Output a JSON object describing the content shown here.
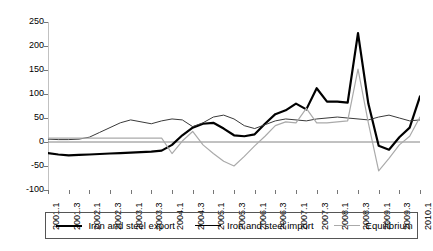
{
  "chart_data": {
    "type": "line",
    "title": "",
    "subtitle": "",
    "xlabel": "",
    "ylabel": "",
    "ylim": [
      -100,
      250
    ],
    "yticks": [
      250,
      200,
      150,
      100,
      50,
      0,
      -50,
      -100
    ],
    "ytick_labels": [
      "250",
      "200",
      "150",
      "100",
      "50",
      "0",
      "-50",
      "-100"
    ],
    "grid": false,
    "legend_position": "bottom",
    "x": [
      "2001.1",
      "2001.2",
      "2001.3",
      "2001.4",
      "2002.1",
      "2002.2",
      "2002.3",
      "2002.4",
      "2003.1",
      "2003.2",
      "2003.3",
      "2003.4",
      "2004.1",
      "2004.2",
      "2004.3",
      "2004.4",
      "2005.1",
      "2005.2",
      "2005.3",
      "2005.4",
      "2006.1",
      "2006.2",
      "2006.3",
      "2006.4",
      "2007.1",
      "2007.2",
      "2007.3",
      "2007.4",
      "2008.1",
      "2008.2",
      "2008.3",
      "2008.4",
      "2009.1",
      "2009.2",
      "2009.3",
      "2009.4",
      "2010.1"
    ],
    "xtick_labels": [
      "2001.1",
      "2001.3",
      "2002.1",
      "2002.3",
      "2003.1",
      "2003.3",
      "2004.1",
      "2004.3",
      "2005.1",
      "2005.3",
      "2006.1",
      "2006.3",
      "2007.1",
      "2007.3",
      "2008.1",
      "2008.3",
      "2009.1",
      "2009.3",
      "2010.1"
    ],
    "xtick_indices": [
      0,
      2,
      4,
      6,
      8,
      10,
      12,
      14,
      16,
      18,
      20,
      22,
      24,
      26,
      28,
      30,
      32,
      34,
      36
    ],
    "series": [
      {
        "name": "Iron and steel export",
        "color": "#000000",
        "width": 2.2,
        "values": [
          -23,
          -26,
          -28,
          -27,
          -26,
          -25,
          -24,
          -23,
          -22,
          -21,
          -20,
          -18,
          -6,
          14,
          30,
          38,
          40,
          28,
          14,
          12,
          16,
          38,
          58,
          66,
          80,
          68,
          112,
          84,
          84,
          82,
          227,
          80,
          -8,
          -16,
          10,
          30,
          95
        ]
      },
      {
        "name": "Iron and steel import",
        "color": "#3a3a3a",
        "width": 1.0,
        "values": [
          6,
          5,
          5,
          6,
          10,
          20,
          30,
          40,
          46,
          42,
          38,
          44,
          48,
          46,
          32,
          40,
          52,
          56,
          48,
          34,
          28,
          36,
          44,
          48,
          46,
          44,
          48,
          50,
          52,
          50,
          48,
          46,
          52,
          56,
          50,
          44,
          46
        ]
      },
      {
        "name": "Equilibrium",
        "color": "#aaaaaa",
        "width": 1.2,
        "values": [
          8,
          8,
          8,
          8,
          8,
          8,
          8,
          8,
          8,
          8,
          8,
          8,
          -24,
          2,
          22,
          -6,
          -24,
          -40,
          -50,
          -30,
          -8,
          12,
          34,
          42,
          40,
          70,
          40,
          40,
          42,
          44,
          152,
          40,
          -60,
          -34,
          -6,
          12,
          52
        ]
      }
    ]
  },
  "legend": {
    "items": [
      {
        "label": "Iron and steel export",
        "swatch": "thick-black-line"
      },
      {
        "label": "Iron and steel import",
        "swatch": "thin-black-line"
      },
      {
        "label": "Equilibrium",
        "swatch": "gray-line"
      }
    ]
  }
}
